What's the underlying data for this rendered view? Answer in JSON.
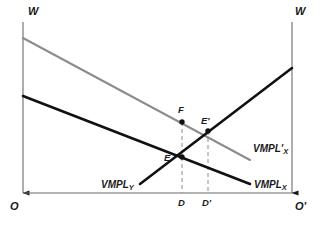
{
  "figure": {
    "type": "economics-edgeworth-labor-allocation-diagram",
    "background_color": "#ffffff"
  },
  "axes": {
    "left_axis_label": "W",
    "right_axis_label": "W",
    "left_origin_label": "O",
    "right_origin_label": "O'",
    "left_axis_x": 23,
    "right_axis_x": 292,
    "baseline_y": 193,
    "top_y": 22,
    "axis_color": "#6b6b6b",
    "arrow_color": "#1a1a1a"
  },
  "curves": [
    {
      "name": "VMPL'X",
      "label_text": "VMPL'",
      "label_subscript": "X",
      "label_x": 253,
      "label_y": 144,
      "color": "#8c8c8c",
      "width": 2,
      "x1": 23,
      "y1": 38,
      "x2": 250,
      "y2": 160,
      "description": "shifted value of marginal product of labor in sector X, downward sloping from left origin"
    },
    {
      "name": "VMPLX",
      "label_text": "VMPL",
      "label_subscript": "X",
      "label_x": 254,
      "label_y": 180,
      "color": "#111111",
      "width": 2.6,
      "x1": 23,
      "y1": 96,
      "x2": 250,
      "y2": 184,
      "description": "original value of marginal product of labor in sector X, downward sloping from left origin"
    },
    {
      "name": "VMPLY",
      "label_text": "VMPL",
      "label_subscript": "Y",
      "label_x": 101,
      "label_y": 180,
      "color": "#111111",
      "width": 2.6,
      "x1": 140,
      "y1": 184,
      "x2": 292,
      "y2": 68,
      "description": "value of marginal product of labor in sector Y, measured from right origin, rising left-to-right"
    }
  ],
  "points": [
    {
      "id": "E",
      "label": "E",
      "x": 182,
      "y": 157,
      "label_x": 164,
      "label_y": 153,
      "marker": true
    },
    {
      "id": "Eprime",
      "label": "E'",
      "x": 208,
      "y": 131,
      "label_x": 201,
      "label_y": 116,
      "marker": true
    },
    {
      "id": "F",
      "label": "F",
      "x": 182,
      "y": 122,
      "label_x": 178,
      "label_y": 105,
      "marker": true
    }
  ],
  "dashed_lines": [
    {
      "id": "D-dashed",
      "x": 182,
      "y_top": 122,
      "y_bottom": 193,
      "color": "#8c8c8c"
    },
    {
      "id": "Dprime-dashed",
      "x": 208,
      "y_top": 131,
      "y_bottom": 193,
      "color": "#8c8c8c"
    }
  ],
  "tick_labels": [
    {
      "id": "D",
      "label": "D",
      "x": 178,
      "y": 198
    },
    {
      "id": "Dprime",
      "label": "D'",
      "x": 202,
      "y": 198
    }
  ]
}
